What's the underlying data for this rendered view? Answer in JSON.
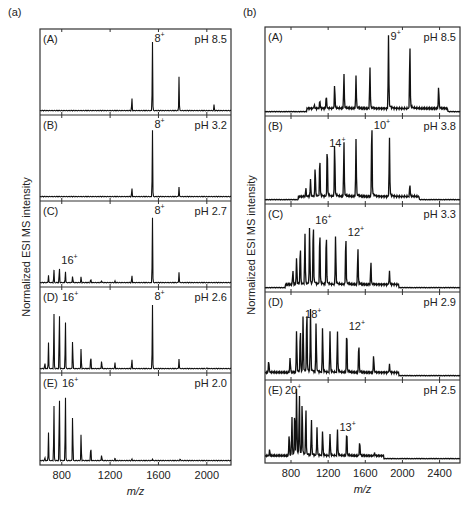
{
  "chart_data": [
    {
      "figure_label": "(a)",
      "type": "line",
      "xlabel": "m/z",
      "ylabel": "Normalized ESI MS intensity",
      "xlim": [
        620,
        2200
      ],
      "x_ticks": [
        800,
        1200,
        1600,
        2000
      ],
      "panels": [
        {
          "label": "(A)",
          "condition": "pH 8.5",
          "annotations": [
            {
              "text": "8+",
              "mz": 1550
            }
          ],
          "peaks": [
            [
              1380,
              0.18
            ],
            [
              1550,
              0.95
            ],
            [
              1770,
              0.45
            ],
            [
              2060,
              0.08
            ]
          ]
        },
        {
          "label": "(B)",
          "condition": "pH 3.2",
          "annotations": [
            {
              "text": "8+",
              "mz": 1550
            }
          ],
          "peaks": [
            [
              1380,
              0.12
            ],
            [
              1550,
              0.92
            ],
            [
              1770,
              0.13
            ]
          ]
        },
        {
          "label": "(C)",
          "condition": "pH 2.7",
          "annotations": [
            {
              "text": "8+",
              "mz": 1550
            },
            {
              "text": "16+",
              "mz": 780
            }
          ],
          "peaks": [
            [
              690,
              0.1
            ],
            [
              735,
              0.18
            ],
            [
              780,
              0.22
            ],
            [
              830,
              0.16
            ],
            [
              890,
              0.1
            ],
            [
              960,
              0.08
            ],
            [
              1040,
              0.05
            ],
            [
              1130,
              0.03
            ],
            [
              1240,
              0.02
            ],
            [
              1380,
              0.1
            ],
            [
              1550,
              0.9
            ],
            [
              1770,
              0.14
            ]
          ]
        },
        {
          "label": "(D)",
          "condition": "pH 2.6",
          "annotations": [
            {
              "text": "8+",
              "mz": 1550
            },
            {
              "text": "16+",
              "mz": 780
            }
          ],
          "peaks": [
            [
              660,
              0.08
            ],
            [
              690,
              0.35
            ],
            [
              735,
              0.78
            ],
            [
              780,
              0.85
            ],
            [
              830,
              0.68
            ],
            [
              890,
              0.42
            ],
            [
              960,
              0.28
            ],
            [
              1040,
              0.2
            ],
            [
              1130,
              0.12
            ],
            [
              1240,
              0.08
            ],
            [
              1380,
              0.13
            ],
            [
              1550,
              0.88
            ],
            [
              1770,
              0.13
            ],
            [
              2000,
              0.01
            ]
          ]
        },
        {
          "label": "(E)",
          "condition": "pH 2.0",
          "annotations": [
            {
              "text": "16+",
              "mz": 780
            }
          ],
          "peaks": [
            [
              660,
              0.04
            ],
            [
              690,
              0.35
            ],
            [
              735,
              0.72
            ],
            [
              780,
              0.9
            ],
            [
              830,
              0.86
            ],
            [
              890,
              0.62
            ],
            [
              960,
              0.34
            ],
            [
              1040,
              0.2
            ],
            [
              1130,
              0.08
            ],
            [
              1240,
              0.03
            ],
            [
              1380,
              0.02
            ],
            [
              1550,
              0.02
            ],
            [
              1780,
              0.02
            ]
          ]
        }
      ]
    },
    {
      "figure_label": "(b)",
      "type": "line",
      "xlabel": "m/z",
      "ylabel": "Normalized ESI MS intensity",
      "xlim": [
        520,
        2620
      ],
      "x_ticks": [
        800,
        1200,
        1600,
        2000,
        2400
      ],
      "panels": [
        {
          "label": "(A)",
          "condition": "pH 8.5",
          "annotations": [
            {
              "text": "9+",
              "mz": 1850
            }
          ],
          "peaks": [
            [
              1050,
              0.05
            ],
            [
              1110,
              0.1
            ],
            [
              1180,
              0.17
            ],
            [
              1270,
              0.3
            ],
            [
              1370,
              0.43
            ],
            [
              1500,
              0.41
            ],
            [
              1650,
              0.51
            ],
            [
              1850,
              0.92
            ],
            [
              2080,
              0.79
            ],
            [
              2390,
              0.28
            ]
          ]
        },
        {
          "label": "(B)",
          "condition": "pH 3.8",
          "annotations": [
            {
              "text": "14+",
              "mz": 1190
            },
            {
              "text": "10+",
              "mz": 1670
            }
          ],
          "peaks": [
            [
              960,
              0.1
            ],
            [
              1010,
              0.22
            ],
            [
              1060,
              0.38
            ],
            [
              1110,
              0.5
            ],
            [
              1190,
              0.66
            ],
            [
              1270,
              0.7
            ],
            [
              1370,
              0.68
            ],
            [
              1500,
              0.73
            ],
            [
              1670,
              0.98
            ],
            [
              1860,
              0.72
            ],
            [
              2080,
              0.15
            ]
          ]
        },
        {
          "label": "(C)",
          "condition": "pH 3.3",
          "annotations": [
            {
              "text": "16+",
              "mz": 1040
            },
            {
              "text": "12+",
              "mz": 1390
            }
          ],
          "peaks": [
            [
              820,
              0.18
            ],
            [
              860,
              0.35
            ],
            [
              900,
              0.5
            ],
            [
              950,
              0.63
            ],
            [
              1000,
              0.73
            ],
            [
              1040,
              0.8
            ],
            [
              1110,
              0.7
            ],
            [
              1180,
              0.68
            ],
            [
              1280,
              0.63
            ],
            [
              1390,
              0.64
            ],
            [
              1520,
              0.47
            ],
            [
              1660,
              0.28
            ],
            [
              1860,
              0.16
            ]
          ]
        },
        {
          "label": "(D)",
          "condition": "pH 2.9",
          "annotations": [
            {
              "text": "18+",
              "mz": 930
            },
            {
              "text": "12+",
              "mz": 1400
            }
          ],
          "peaks": [
            [
              560,
              0.16
            ],
            [
              790,
              0.2
            ],
            [
              860,
              0.55
            ],
            [
              900,
              0.58
            ],
            [
              930,
              0.72
            ],
            [
              970,
              0.82
            ],
            [
              1010,
              0.8
            ],
            [
              1070,
              0.63
            ],
            [
              1140,
              0.58
            ],
            [
              1220,
              0.53
            ],
            [
              1300,
              0.51
            ],
            [
              1400,
              0.56
            ],
            [
              1530,
              0.38
            ],
            [
              1690,
              0.22
            ],
            [
              1860,
              0.1
            ]
          ]
        },
        {
          "label": "(E)",
          "condition": "pH 2.5",
          "annotations": [
            {
              "text": "20+",
              "mz": 860
            },
            {
              "text": "13+",
              "mz": 1300
            }
          ],
          "peaks": [
            [
              570,
              0.08
            ],
            [
              780,
              0.3
            ],
            [
              810,
              0.5
            ],
            [
              840,
              0.62
            ],
            [
              860,
              0.92
            ],
            [
              890,
              0.82
            ],
            [
              920,
              0.72
            ],
            [
              960,
              0.62
            ],
            [
              1020,
              0.48
            ],
            [
              1080,
              0.38
            ],
            [
              1140,
              0.34
            ],
            [
              1220,
              0.3
            ],
            [
              1300,
              0.35
            ],
            [
              1400,
              0.34
            ],
            [
              1540,
              0.2
            ],
            [
              1700,
              0.04
            ]
          ]
        }
      ]
    }
  ]
}
